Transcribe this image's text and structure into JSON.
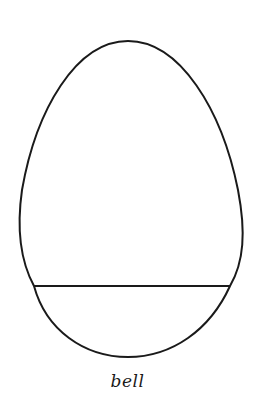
{
  "figure": {
    "shape": "egg",
    "stroke_color": "#1a1a1a",
    "background": "#ffffff",
    "divider": "horizontal line near base",
    "label": "bell"
  }
}
